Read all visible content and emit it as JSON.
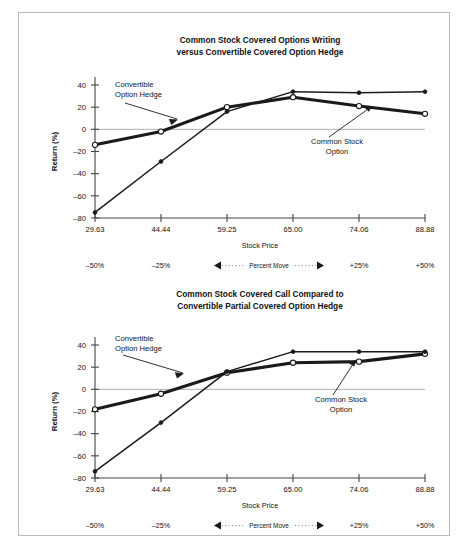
{
  "figure": {
    "background": "#ffffff",
    "border_color": "#b9b9b9",
    "ink_color": "#1a1a1a"
  },
  "chart_data": [
    {
      "id": "top",
      "type": "line",
      "title_line1": "Common Stock Covered Options Writing",
      "title_line2": "versus Convertible Covered Option Hedge",
      "xlabel": "Stock Price",
      "ylabel": "Return (%)",
      "categories": [
        "29.63",
        "44.44",
        "59.25",
        "65.00",
        "74.06",
        "88.88"
      ],
      "percent_move": [
        "–50%",
        "–25%",
        "",
        "",
        "+25%",
        "+50%"
      ],
      "percent_move_label": "Percent Move",
      "yticks": [
        "40",
        "20",
        "0",
        "–20",
        "–40",
        "–60",
        "–80"
      ],
      "ytick_values": [
        40,
        20,
        0,
        -20,
        -40,
        -60,
        -80
      ],
      "ylim": [
        -80,
        44
      ],
      "grid": false,
      "zero_line": true,
      "legend_position": "inline-annotations",
      "series": [
        {
          "name": "Convertible Option Hedge",
          "style": "thick",
          "marker": "open-circle",
          "values": [
            -14,
            -2,
            20,
            29,
            21,
            14
          ]
        },
        {
          "name": "Common Stock Option",
          "style": "thin",
          "marker": "solid-dot",
          "values": [
            -75,
            -29,
            16,
            34,
            33,
            34
          ]
        }
      ],
      "annotations": [
        {
          "name": "convertible-option-hedge",
          "text_line1": "Convertible",
          "text_line2": "Option Hedge"
        },
        {
          "name": "common-stock-option",
          "text_line1": "Common Stock",
          "text_line2": "Option"
        }
      ]
    },
    {
      "id": "bottom",
      "type": "line",
      "title_line1": "Common Stock Covered Call  Compared to",
      "title_line2": "Convertible Partial Covered Option Hedge",
      "xlabel": "Stock Price",
      "ylabel": "Return (%)",
      "categories": [
        "29.63",
        "44.44",
        "59.25",
        "65.00",
        "74.06",
        "88.88"
      ],
      "percent_move": [
        "–50%",
        "–25%",
        "",
        "",
        "+25%",
        "+50%"
      ],
      "percent_move_label": "Percent Move",
      "yticks": [
        "40",
        "20",
        "0",
        "–20",
        "–40",
        "–60",
        "–80"
      ],
      "ytick_values": [
        40,
        20,
        0,
        -20,
        -40,
        -60,
        -80
      ],
      "ylim": [
        -80,
        44
      ],
      "grid": false,
      "zero_line": true,
      "legend_position": "inline-annotations",
      "series": [
        {
          "name": "Convertible Option Hedge",
          "style": "thick",
          "marker": "open-circle",
          "values": [
            -18,
            -4,
            15,
            24,
            25,
            32
          ]
        },
        {
          "name": "Common Stock Option",
          "style": "thin",
          "marker": "solid-dot",
          "values": [
            -74,
            -30,
            16,
            34,
            34,
            34
          ]
        }
      ],
      "annotations": [
        {
          "name": "convertible-option-hedge",
          "text_line1": "Convertible",
          "text_line2": "Option Hedge"
        },
        {
          "name": "common-stock-option",
          "text_line1": "Common Stock",
          "text_line2": "Option"
        }
      ]
    }
  ]
}
